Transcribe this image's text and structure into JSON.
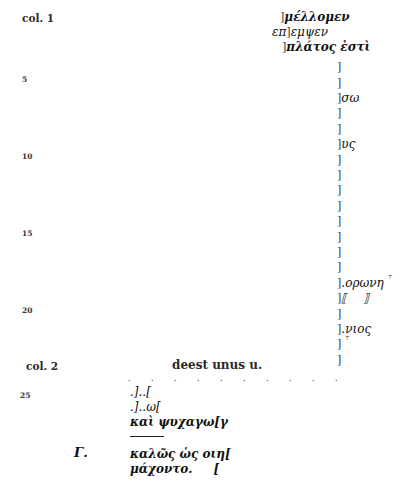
{
  "col1": {
    "label": "col. 1",
    "line_numbers": [
      "5",
      "10",
      "15",
      "20"
    ],
    "lines": [
      {
        "n": 1,
        "pre": "",
        "bracket": "]",
        "text": "μέλλομεν",
        "mark": ""
      },
      {
        "n": 2,
        "pre": "επ",
        "bracket": "]",
        "text": "εμψεν",
        "mark": ""
      },
      {
        "n": 3,
        "pre": "",
        "bracket": "]",
        "text": "πλάτος ἐστὶ",
        "mark": ""
      },
      {
        "n": 4,
        "pre": "",
        "bracket": "]",
        "text": "",
        "mark": ""
      },
      {
        "n": 5,
        "pre": "",
        "bracket": "]",
        "text": "",
        "mark": ""
      },
      {
        "n": 6,
        "pre": "",
        "bracket": "]",
        "text": "σω",
        "mark": ""
      },
      {
        "n": 7,
        "pre": "",
        "bracket": "]",
        "text": "",
        "mark": ""
      },
      {
        "n": 8,
        "pre": "",
        "bracket": "]",
        "text": "",
        "mark": ""
      },
      {
        "n": 9,
        "pre": "",
        "bracket": "]",
        "text": "υς",
        "mark": ""
      },
      {
        "n": 10,
        "pre": "",
        "bracket": "]",
        "text": "",
        "mark": ""
      },
      {
        "n": 11,
        "pre": "",
        "bracket": "]",
        "text": "",
        "mark": ""
      },
      {
        "n": 12,
        "pre": "",
        "bracket": "]",
        "text": "",
        "mark": ""
      },
      {
        "n": 13,
        "pre": "",
        "bracket": "]",
        "text": "",
        "mark": ""
      },
      {
        "n": 14,
        "pre": "",
        "bracket": "]",
        "text": "",
        "mark": ""
      },
      {
        "n": 15,
        "pre": "",
        "bracket": "]",
        "text": "",
        "mark": ""
      },
      {
        "n": 16,
        "pre": "",
        "bracket": "]",
        "text": "",
        "mark": ""
      },
      {
        "n": 17,
        "pre": "",
        "bracket": "]",
        "text": "",
        "mark": ""
      },
      {
        "n": 18,
        "pre": "",
        "bracket": "]",
        "text": ".ορωνη",
        "mark": "⸆"
      },
      {
        "n": 19,
        "pre": "",
        "bracket": "]",
        "text": "⟦    ⟧",
        "mark": ""
      },
      {
        "n": 20,
        "pre": "",
        "bracket": "]",
        "text": "",
        "mark": ""
      },
      {
        "n": 21,
        "pre": "",
        "bracket": "]",
        "text": ".νιος",
        "mark": ""
      },
      {
        "n": 22,
        "pre": "",
        "bracket": "]",
        "text": "",
        "mark": "⸆"
      },
      {
        "n": 23,
        "pre": "",
        "bracket": "]",
        "text": "",
        "mark": ""
      }
    ]
  },
  "col2": {
    "label": "col. 2",
    "heading": "deest unus u.",
    "dots": ". . . . . . . . . .",
    "line_numbers": [
      "25"
    ],
    "lines": [
      {
        "text": ".]..["
      },
      {
        "text": ".]..ω["
      },
      {
        "text": "καὶ ψυχαγω[γ"
      }
    ],
    "speaker": "Γ.",
    "after_rule": [
      {
        "text": "καλῶς ὡς οιη["
      },
      {
        "text": "μάχοντο.     ["
      }
    ]
  }
}
